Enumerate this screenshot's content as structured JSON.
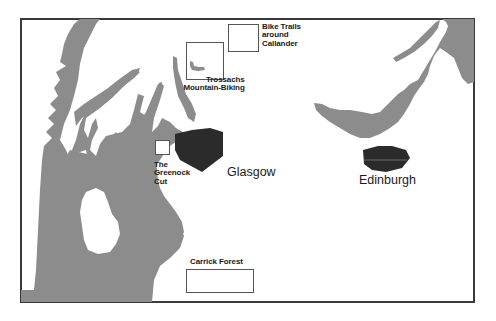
{
  "map": {
    "colors": {
      "water": "#8c8c8c",
      "land": "#ffffff",
      "urban": "#2b2b2b",
      "frame": "#3a3a3a",
      "box_border": "#555555",
      "text": "#1a1a1a"
    },
    "cities": [
      {
        "name": "Glasgow"
      },
      {
        "name": "Edinburgh"
      }
    ],
    "areas": [
      {
        "name_lines": [
          "Bike Trails",
          "around",
          "Callander"
        ]
      },
      {
        "name_lines": [
          "Trossachs",
          "Mountain-Biking"
        ]
      },
      {
        "name_lines": [
          "The",
          "Greenock",
          "Cut"
        ]
      },
      {
        "name_lines": [
          "Carrick Forest"
        ]
      }
    ]
  }
}
